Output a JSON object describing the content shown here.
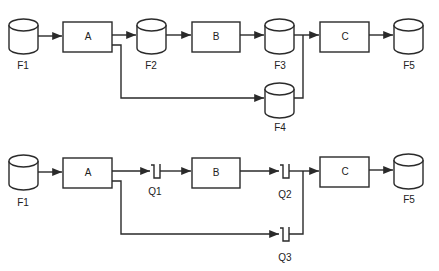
{
  "diagrams": [
    {
      "id": "top",
      "title": "Data flow with intermediate files",
      "nodes": [
        {
          "id": "F1",
          "type": "file",
          "label": "F1"
        },
        {
          "id": "A",
          "type": "process",
          "label": "A"
        },
        {
          "id": "F2",
          "type": "file",
          "label": "F2"
        },
        {
          "id": "B",
          "type": "process",
          "label": "B"
        },
        {
          "id": "F3",
          "type": "file",
          "label": "F3"
        },
        {
          "id": "F4",
          "type": "file",
          "label": "F4"
        },
        {
          "id": "C",
          "type": "process",
          "label": "C"
        },
        {
          "id": "F5",
          "type": "file",
          "label": "F5"
        }
      ],
      "edges": [
        [
          "F1",
          "A"
        ],
        [
          "A",
          "F2"
        ],
        [
          "F2",
          "B"
        ],
        [
          "B",
          "F3"
        ],
        [
          "F3",
          "C"
        ],
        [
          "A",
          "F4"
        ],
        [
          "F4",
          "C"
        ],
        [
          "C",
          "F5"
        ]
      ]
    },
    {
      "id": "bottom",
      "title": "Data flow with queues",
      "nodes": [
        {
          "id": "F1",
          "type": "file",
          "label": "F1"
        },
        {
          "id": "A",
          "type": "process",
          "label": "A"
        },
        {
          "id": "Q1",
          "type": "queue",
          "label": "Q1"
        },
        {
          "id": "B",
          "type": "process",
          "label": "B"
        },
        {
          "id": "Q2",
          "type": "queue",
          "label": "Q2"
        },
        {
          "id": "Q3",
          "type": "queue",
          "label": "Q3"
        },
        {
          "id": "C",
          "type": "process",
          "label": "C"
        },
        {
          "id": "F5",
          "type": "file",
          "label": "F5"
        }
      ],
      "edges": [
        [
          "F1",
          "A"
        ],
        [
          "A",
          "Q1"
        ],
        [
          "Q1",
          "B"
        ],
        [
          "B",
          "Q2"
        ],
        [
          "Q2",
          "C"
        ],
        [
          "A",
          "Q3"
        ],
        [
          "Q3",
          "C"
        ],
        [
          "C",
          "F5"
        ]
      ]
    }
  ],
  "labels": {
    "top": {
      "F1": "F1",
      "A": "A",
      "F2": "F2",
      "B": "B",
      "F3": "F3",
      "F4": "F4",
      "C": "C",
      "F5": "F5"
    },
    "bottom": {
      "F1": "F1",
      "A": "A",
      "Q1": "Q1",
      "B": "B",
      "Q2": "Q2",
      "Q3": "Q3",
      "C": "C",
      "F5": "F5"
    }
  },
  "colors": {
    "line": "#2a2a2a",
    "background": "#ffffff",
    "text": "#222222"
  }
}
